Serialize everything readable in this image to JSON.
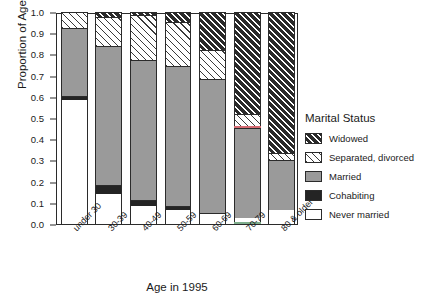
{
  "chart_data": {
    "type": "bar",
    "stacked": true,
    "title": "",
    "xlabel": "Age in 1995",
    "ylabel": "Proportion of Age Group",
    "ylim": [
      0.0,
      1.0
    ],
    "yticks": [
      "0.0",
      "0.1",
      "0.2",
      "0.3",
      "0.4",
      "0.5",
      "0.6",
      "0.7",
      "0.8",
      "0.9",
      "1.0"
    ],
    "ytick_values": [
      0.0,
      0.1,
      0.2,
      0.3,
      0.4,
      0.5,
      0.6,
      0.7,
      0.8,
      0.9,
      1.0
    ],
    "grid": false,
    "legend_position": "right",
    "legend_title": "Marital Status",
    "categories": [
      "under 30",
      "30-39",
      "40-49",
      "50-59",
      "60-69",
      "70-79",
      "80 & older"
    ],
    "series": [
      {
        "name": "Never married",
        "fill": "never",
        "values": [
          0.585,
          0.143,
          0.085,
          0.065,
          0.045,
          0.03,
          0.065
        ]
      },
      {
        "name": "Cohabiting",
        "fill": "cohabiting",
        "values": [
          0.02,
          0.042,
          0.03,
          0.018,
          0.008,
          0.0,
          0.0
        ]
      },
      {
        "name": "Married",
        "fill": "married",
        "values": [
          0.32,
          0.655,
          0.66,
          0.662,
          0.632,
          0.425,
          0.235
        ]
      },
      {
        "name": "Separated, divorced",
        "fill": "separated-divorced",
        "values": [
          0.075,
          0.135,
          0.21,
          0.21,
          0.135,
          0.065,
          0.035
        ]
      },
      {
        "name": "Widowed",
        "fill": "widowed",
        "values": [
          0.0,
          0.025,
          0.015,
          0.045,
          0.18,
          0.48,
          0.665
        ]
      }
    ],
    "legend_entries": [
      {
        "label": "Widowed",
        "fill": "widowed"
      },
      {
        "label": "Separated, divorced",
        "fill": "separated-divorced"
      },
      {
        "label": "Married",
        "fill": "married"
      },
      {
        "label": "Cohabiting",
        "fill": "cohabiting"
      },
      {
        "label": "Never married",
        "fill": "never"
      }
    ],
    "colors": {
      "widowed": "#2a2a2a",
      "separated_divorced": "#ffffff",
      "married": "#9a9a9a",
      "cohabiting": "#242424",
      "never_married": "#ffffff",
      "axis": "#2b2b2b",
      "text": "#1a1a1a",
      "background": "#ffffff"
    }
  }
}
